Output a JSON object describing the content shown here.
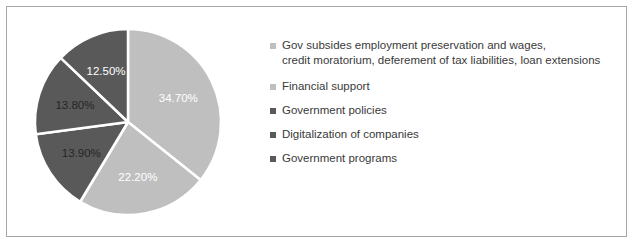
{
  "chart_data": {
    "type": "pie",
    "title": "",
    "labels": [
      "Gov subsides employment preservation and wages, credit moratorium, deferement of tax liabilities, loan extensions",
      "Financial support",
      "Government policies",
      "Digitalization of companies",
      "Government programs"
    ],
    "values": [
      34.7,
      22.2,
      13.9,
      13.8,
      12.5
    ],
    "value_labels": [
      "34.70%",
      "22.20%",
      "13.90%",
      "13.80%",
      "12.50%"
    ],
    "colors": [
      "#bfbfbf",
      "#bfbfbf",
      "#595959",
      "#595959",
      "#595959"
    ],
    "label_text_colors": [
      "#ffffff",
      "#ffffff",
      "#262626",
      "#262626",
      "#ffffff"
    ],
    "start_angle_deg": 0,
    "direction": "clockwise",
    "separator_color": "#ffffff",
    "legend_position": "right",
    "grid": false
  },
  "legend": {
    "items": [
      {
        "marker_name": "legend-swatch-gov-subsides",
        "color": "#bfbfbf",
        "label": "Gov subsides employment preservation and wages,\ncredit moratorium, deferement of tax liabilities, loan extensions"
      },
      {
        "marker_name": "legend-swatch-financial-support",
        "color": "#bfbfbf",
        "label": "Financial support"
      },
      {
        "marker_name": "legend-swatch-government-policies",
        "color": "#595959",
        "label": "Government policies"
      },
      {
        "marker_name": "legend-swatch-digitalization",
        "color": "#595959",
        "label": "Digitalization of companies"
      },
      {
        "marker_name": "legend-swatch-government-programs",
        "color": "#595959",
        "label": "Government programs"
      }
    ]
  },
  "slice_labels": {
    "s0": "34.70%",
    "s1": "22.20%",
    "s2": "13.90%",
    "s3": "13.80%",
    "s4": "12.50%"
  },
  "style": {
    "frame_border_color": "#a6a6a6",
    "background": "#ffffff",
    "legend_text_color": "#3a3a3a"
  }
}
